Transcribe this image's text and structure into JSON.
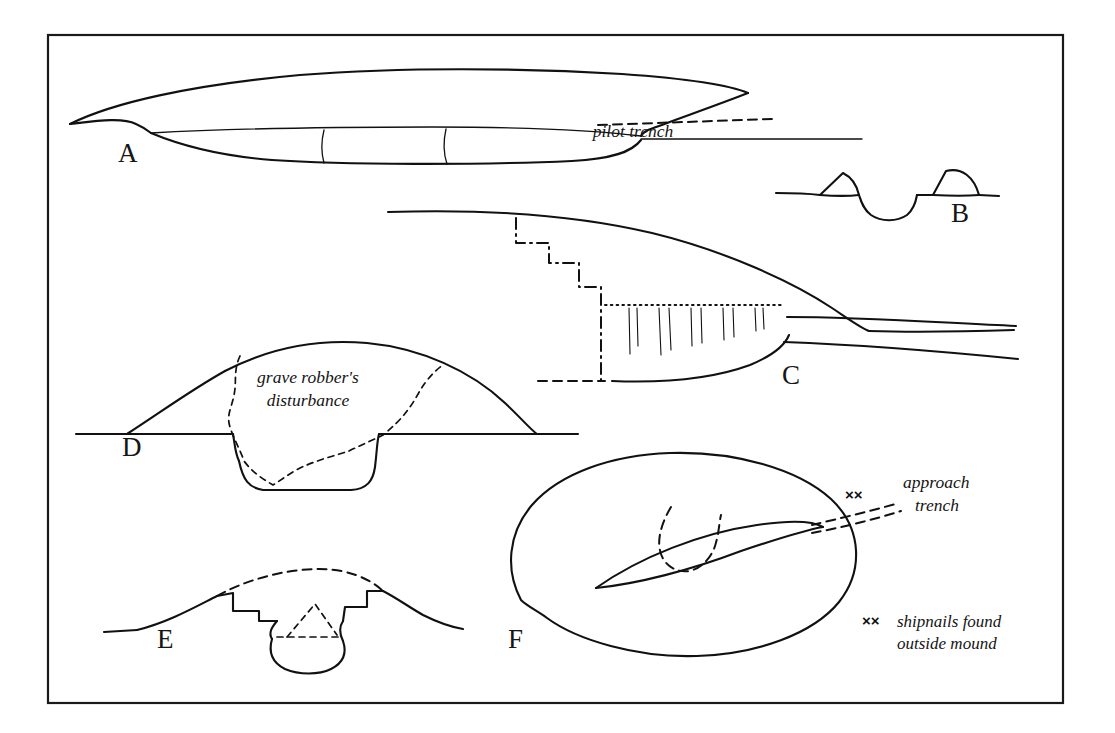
{
  "figure": {
    "frame": {
      "x": 48,
      "y": 35,
      "width": 1015,
      "height": 668,
      "color": "#1a1a1a"
    },
    "ink_color": "#111111",
    "background": "#ffffff"
  },
  "panels": [
    {
      "id": "A",
      "letter": "A",
      "letter_x": 118,
      "letter_y": 162,
      "description": "Longitudinal section of ship under mound with pilot trench"
    },
    {
      "id": "B",
      "letter": "B",
      "letter_x": 951,
      "letter_y": 222,
      "description": "Section with two mound remnants flanking a central excavated hollow"
    },
    {
      "id": "C",
      "letter": "C",
      "letter_x": 782,
      "letter_y": 384,
      "description": "Section of mound edge with stepped dash-dot excavation limit and hatched deposit"
    },
    {
      "id": "D",
      "letter": "D",
      "letter_x": 122,
      "letter_y": 456,
      "description": "Mound section with grave robber's disturbance shown dashed"
    },
    {
      "id": "E",
      "letter": "E",
      "letter_x": 157,
      "letter_y": 648,
      "description": "Small mound section with reconstructed profile and stepped trench"
    },
    {
      "id": "F",
      "letter": "F",
      "letter_x": 508,
      "letter_y": 648,
      "description": "Plan view of oval mound with ship impression and approach trench"
    }
  ],
  "annotations": {
    "pilot_trench": {
      "text": "pilot trench",
      "x": 633,
      "y": 137,
      "style": "italic"
    },
    "grave_robbers": {
      "line1": "grave robber's",
      "line2": "disturbance",
      "x": 308,
      "y1": 383,
      "y2": 406,
      "style": "italic"
    },
    "approach_trench": {
      "line1": "approach",
      "line2": "trench",
      "x": 903,
      "y1": 488,
      "y2": 511,
      "style": "italic"
    },
    "shipnails_key": {
      "marks": "××",
      "marks_x": 862,
      "marks_y": 626,
      "line1": "shipnails found",
      "line2": "outside mound",
      "x": 897,
      "y1": 627,
      "y2": 649,
      "style": "italic"
    },
    "shipnails_plan_marks": {
      "marks": "××",
      "x": 845,
      "y": 500
    }
  },
  "geometry": {
    "panel_a": {
      "mound_outline": "M 70,124 C 110,104 190,86 300,76 C 400,68 520,68 620,74 C 690,79 730,86 745,92",
      "mound_base_right": "M 745,92 L 745,92",
      "mound_left_kink": "M 70,124 C 95,121 120,118 134,124 C 142,127 146,130 150,133",
      "hull_sheer": "M 150,133 C 240,129 330,128 430,128 C 520,128 590,130 640,133",
      "hull_bottom": "M 150,133 C 180,145 220,155 270,159 C 340,164 480,164 570,160 C 610,158 630,152 640,141",
      "bulkhead1": "M 324,131 C 322,142 322,152 324,162",
      "bulkhead2": "M 445,130 C 443,142 443,152 446,163",
      "ground_line": "M 640,141 L 862,141",
      "pilot_dash": "M 600,125 L 770,119",
      "slope_to_ground": "M 600,112 C 620,119 635,128 643,138"
    },
    "panel_b": {
      "ground_left": "M 776,195 L 845,194",
      "hump_left": "M 818,196 L 842,174 C 852,178 856,186 858,195",
      "hollow": "M 858,195 C 860,200 862,207 870,213 C 880,220 896,220 906,213 C 913,207 915,200 916,195",
      "ground_mid": "M 916,195 L 932,195",
      "hump_right": "M 932,195 L 945,172 C 960,168 972,177 977,195",
      "ground_right": "M 977,195 L 998,196"
    },
    "panel_c": {
      "mound_top": "M 388,212 C 480,209 570,213 650,232 C 720,249 790,280 830,307 C 848,319 860,327 868,330",
      "ground_right_upper": "M 868,330 C 900,331 950,332 1012,330",
      "ground_far_right": "M 790,318 C 860,318 930,322 1015,325",
      "ground_right_lower": "M 786,342 C 870,345 950,352 1018,358",
      "trench_base": "M 612,380 C 660,382 710,378 748,364 C 772,354 784,344 788,334",
      "dashdot_step": "M 516,218 L 516,242 L 548,242 L 548,262 L 578,262 L 578,286 L 600,286 L 600,305 L 600,378",
      "dash_bottom": "M 540,380 L 612,380",
      "dotted_line": "M 604,305 L 780,305",
      "hatch_x": [
        629,
        636,
        658,
        668,
        690,
        700,
        722,
        732,
        754,
        762
      ],
      "hatch_top": 308,
      "hatch_len": [
        46,
        38,
        46,
        42,
        38,
        36,
        32,
        30,
        24,
        22
      ]
    },
    "panel_d": {
      "ground_left": "M 76,434 L 126,434",
      "mound_left_slope": "M 126,434 C 160,412 190,390 224,372",
      "mound_arc": "M 224,372 C 270,348 320,340 366,344 C 420,349 470,372 504,404 C 520,419 530,430 536,434",
      "ground_under_mound_left": "M 126,434 L 232,434",
      "ground_right": "M 536,434 L 578,434",
      "pit_left": "M 232,434 C 234,444 234,452 238,460",
      "pit_bottom": "M 238,460 C 242,479 248,487 262,489 L 350,489 C 366,488 372,480 374,466",
      "pit_right": "M 374,466 C 376,450 376,440 378,434",
      "ground_mid_right": "M 378,434 L 536,434",
      "robber_dashed": "M 239,357 C 232,372 236,383 233,396 C 231,408 225,416 229,428 C 233,441 239,450 243,462 C 252,474 262,480 272,486 C 282,480 294,470 306,466 C 320,460 336,456 348,452 C 360,446 372,441 382,436 C 392,428 400,420 406,412 C 414,402 418,392 424,384 C 430,376 436,370 442,366"
    },
    "panel_e": {
      "ground_left": "M 104,632 L 136,630",
      "slope_left": "M 136,630 C 168,622 196,606 216,596",
      "step_a": "M 216,596 L 232,593 L 232,610 L 258,610 L 258,620 L 276,620",
      "cut_left": "M 276,620 C 272,626 268,632 272,638",
      "bowl": "M 272,638 C 268,652 272,662 284,668 C 298,674 318,674 330,668 C 342,662 346,652 342,640",
      "cut_right": "M 342,640 C 338,632 338,626 342,620",
      "step_b": "M 342,620 L 344,607 L 366,607 L 366,591 L 382,591",
      "slope_right": "M 382,591 C 394,597 408,606 422,614 C 436,621 450,626 462,628",
      "reconstructed": "M 216,596 C 250,578 290,570 318,570 C 346,570 368,578 382,591",
      "dotted_tent": "M 286,636 L 314,605 L 336,634",
      "dashed_floor": "M 276,636 L 340,636"
    },
    "panel_f": {
      "oval": "M 522,600 C 506,570 508,534 532,506 C 560,474 612,456 670,454 C 734,452 798,470 830,500 C 862,530 862,572 838,602 C 812,634 756,654 696,656 C 636,658 576,640 546,618 C 536,611 528,606 522,600",
      "ship_lens_top": "M 596,588 C 640,558 700,534 756,526 C 790,521 812,522 822,528",
      "ship_lens_bottom": "M 596,588 C 636,584 690,570 740,552 C 782,538 810,530 822,528",
      "chamber_dashed": "M 670,508 C 662,522 656,540 660,554 C 664,566 676,572 688,570 C 700,568 710,558 714,546 C 718,534 718,524 720,516",
      "trench_line_top": "M 812,526 C 836,520 870,512 898,504",
      "trench_line_bottom": "M 812,532 C 838,528 872,520 900,512"
    }
  }
}
